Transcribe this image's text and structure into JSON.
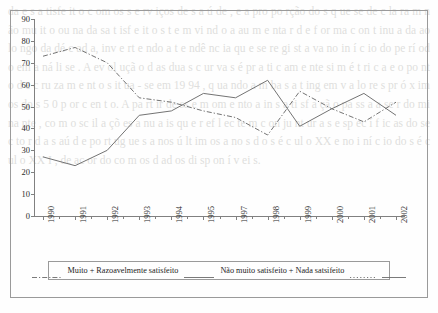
{
  "chart_data": {
    "type": "line",
    "title": "",
    "xlabel": "",
    "ylabel": "",
    "categories": [
      "1990",
      "1991",
      "1992",
      "1993",
      "1994",
      "1995",
      "1997",
      "1998",
      "1999",
      "2000",
      "2001",
      "2002"
    ],
    "ylim": [
      0,
      90
    ],
    "yticks": [
      0,
      10,
      20,
      30,
      40,
      50,
      60,
      70,
      80,
      90
    ],
    "grid": false,
    "legend_position": "bottom",
    "series": [
      {
        "name": "Muito + Razoavelmente satisfeito",
        "style": "dash-dot",
        "color": "#6b6b6b",
        "values": [
          73,
          77,
          70,
          54,
          52,
          48,
          45,
          37,
          57,
          49,
          43,
          52
        ]
      },
      {
        "name": "Não muito satisfeito + Nada satsifeito",
        "style": "solid",
        "color": "#6b6b6b",
        "values": [
          27,
          23,
          30,
          46,
          48,
          56,
          54,
          62,
          41,
          49,
          56,
          46
        ]
      }
    ]
  },
  "legend": {
    "entries": [
      {
        "label": "Muito + Razoavelmente satisfeito",
        "swatch": "dash-dot"
      },
      {
        "label": "Não muito satisfeito + Nada satsifeito",
        "swatch": "solid"
      }
    ],
    "trailing_swatch_dotted": "",
    "trailing_swatch_solid": ""
  },
  "background_text": "da e  s a tisfe  it o  c om  os  s e rv iços  de  s a ú de ,  e  a  pro po rção do s  q ue  se  de c la ra m  n ão mu it o  ou  na da  sa t isf e it o s  t e m vi nd o  a  au m e nta r  d e  f or ma  c on t inu a da  ao  lo ngo  da  dé c ad a,  inv e rt e ndo  a  t e ndê nc ia  qu e  se  re gi st a va  no  in í c io  do  pe rí od o em  a ná li se .  A  ev ol uçã o  d as  dua s  c ur va s  é  pr a ti c am e nte  si m é t ri c a  e  o  po nt o  d e  c ru za m e nt o  s it ua - se  em  19 94 ,  q ua ndo  a m ba s  a t ing em  v a lo re s  pr ó x im os  do s  5 0  p or  c en t o.  A  pa rt ir  de ss e  m om e nto  a  in s a ti sf a çã o  pa ss a  a  se r  do mi na nte ,  co m  o sc il a çõ es  a nu a is  qu e  r ef l ec te m  c on ju nt ur a s  e sp ec í f ic as  do  se c to r  d a  s aú d e  po rt ug ue s a  nos  ú lt im os  a no s  d o  s é c ul o  XX  e  no  i ní c io  do  s é c ul o  XX I ,  de  ac or do  co m  os  d ad os  di sp on í v ei s."
}
